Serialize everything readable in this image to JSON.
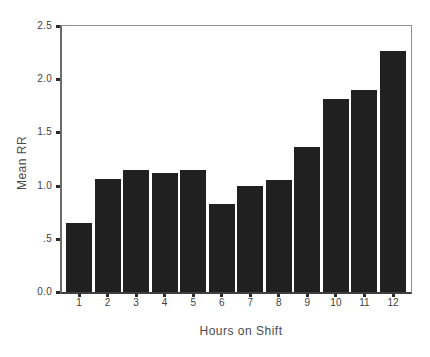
{
  "chart_data": {
    "type": "bar",
    "title": "",
    "xlabel": "Hours on Shift",
    "ylabel": "Mean RR",
    "categories": [
      "1",
      "2",
      "3",
      "4",
      "5",
      "6",
      "7",
      "8",
      "9",
      "10",
      "11",
      "12"
    ],
    "values": [
      0.65,
      1.06,
      1.15,
      1.12,
      1.15,
      0.83,
      1.0,
      1.05,
      1.36,
      1.81,
      1.9,
      2.27
    ],
    "ylim": [
      0.0,
      2.5
    ],
    "y_ticks": [
      "2.5",
      "2.0",
      "1.5",
      "1.0",
      ".5",
      "0.0"
    ],
    "y_tick_values": [
      2.5,
      2.0,
      1.5,
      1.0,
      0.5,
      0.0
    ],
    "grid": false,
    "legend": "none",
    "bar_color": "#202020",
    "frame_color": "#919191",
    "axis_color": "#3f3f3f",
    "text_color": "#4a4a4a",
    "background_color": "#ffffff"
  }
}
